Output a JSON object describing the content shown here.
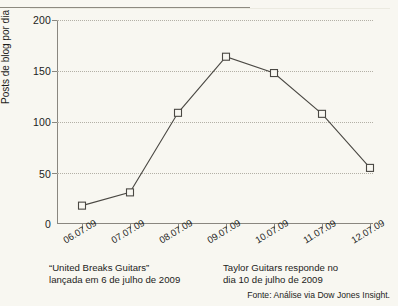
{
  "chart_data": {
    "type": "line",
    "title": "",
    "subtitle": "",
    "xlabel": "",
    "ylabel": "Posts de blog por dia",
    "categories": [
      "06.07.09",
      "07.07.09",
      "08.07.09",
      "09.07.09",
      "10.07.09",
      "11.07.09",
      "12.07.09"
    ],
    "values": [
      18,
      31,
      109,
      164,
      148,
      108,
      55
    ],
    "series": [
      {
        "name": "Posts de blog por dia",
        "values": [
          18,
          31,
          109,
          164,
          148,
          108,
          55
        ]
      }
    ],
    "ylim": [
      0,
      200
    ],
    "yticks": [
      0,
      50,
      100,
      150,
      200
    ],
    "ytick_labels": [
      "0",
      "50",
      "100",
      "150",
      "200"
    ],
    "grid": "horizontal-dotted",
    "legend": "none",
    "marker": "open-square",
    "line_color": "#4a4843",
    "grid_color": "#b3b0a6",
    "axis_color": "#8a8780",
    "background_color": "#f8f7f1",
    "annotations": [
      "“United Breaks Guitars” lançada em 6 de julho de 2009",
      "Taylor Guitars responde no dia 10 de julho de 2009"
    ]
  },
  "axis": {
    "y_title": "Posts de blog por dia",
    "y_labels": [
      "200",
      "150",
      "100",
      "50",
      "0"
    ],
    "x_labels": [
      "06.07.09",
      "07.07.09",
      "08.07.09",
      "09.07.09",
      "10.07.09",
      "11.07.09",
      "12.07.09"
    ]
  },
  "captions": {
    "left_line1": "“United Breaks Guitars”",
    "left_line2": "lançada em 6 de julho de 2009",
    "right_line1": "Taylor Guitars responde no",
    "right_line2": "dia 10 de julho de 2009",
    "source": "Fonte: Análise via Dow Jones Insight."
  }
}
